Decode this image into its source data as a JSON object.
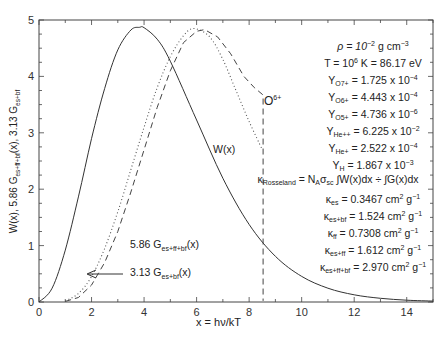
{
  "chart_data": {
    "type": "line",
    "title": "",
    "xlabel": "x = hν/kT",
    "ylabel": "W(x), 5.86 G_es+ff+bf(x), 3.13 G_es+bf",
    "xlim": [
      0,
      15
    ],
    "ylim": [
      0,
      5
    ],
    "x_ticks": [
      "0",
      "2",
      "4",
      "6",
      "8",
      "10",
      "12",
      "14"
    ],
    "y_ticks": [
      "0",
      "1",
      "2",
      "3",
      "4",
      "5"
    ],
    "grid": false,
    "series": [
      {
        "name": "W(x)",
        "style": "solid",
        "x": [
          0,
          0.5,
          1,
          1.5,
          2,
          2.5,
          3,
          3.5,
          3.83,
          4,
          4.5,
          5,
          6,
          7,
          8,
          9,
          10,
          11,
          12,
          13,
          14,
          15
        ],
        "y": [
          0,
          0.245,
          0.921,
          1.863,
          2.896,
          3.788,
          4.469,
          4.823,
          4.87,
          4.863,
          4.659,
          4.269,
          3.227,
          2.194,
          1.375,
          0.81,
          0.454,
          0.245,
          0.127,
          0.065,
          0.032,
          0.016
        ]
      },
      {
        "name": "5.86 G_es+ff+bf(x)",
        "style": "dotted",
        "x": [
          1,
          1.5,
          2,
          2.5,
          3,
          3.5,
          4,
          4.5,
          5,
          5.5,
          5.9,
          6.5,
          7,
          7.5,
          8,
          8.5
        ],
        "y": [
          0.02,
          0.15,
          0.45,
          0.95,
          1.6,
          2.35,
          3.1,
          3.8,
          4.35,
          4.72,
          4.85,
          4.7,
          4.3,
          3.75,
          3.2,
          2.7
        ]
      },
      {
        "name": "3.13 G_es+bf(x)",
        "style": "dashed",
        "x": [
          1,
          1.5,
          2,
          2.5,
          3,
          3.5,
          4,
          4.5,
          5,
          5.5,
          6,
          6.3,
          6.8,
          7.3,
          7.8,
          8.2,
          8.53,
          8.53
        ],
        "y": [
          0.01,
          0.08,
          0.3,
          0.7,
          1.25,
          1.95,
          2.7,
          3.45,
          4.1,
          4.6,
          4.8,
          4.83,
          4.7,
          4.4,
          4.0,
          3.8,
          3.67,
          0.02
        ]
      }
    ],
    "annotations": [
      "O6+",
      "W(x)",
      "5.86 G_es+ff+bf(x)",
      "3.13 G_es+bf(x)"
    ]
  },
  "labels": {
    "xlabel": "x = hν/kT",
    "o6": "O",
    "o6_sup": "6+",
    "wx": "W(x)",
    "g1_pre": "5.86 G",
    "g1_sub": "es+ff+bf",
    "g1_post": "(x)",
    "g2_pre": "3.13 G",
    "g2_sub": "es+bf",
    "g2_post": "(x)",
    "y_pre": "W(x), 5.86 G",
    "y_sub1": "es+ff+bf",
    "y_mid": "(x), 3.13 G",
    "y_sub2": "es+bf"
  },
  "params": {
    "rho": {
      "pre": "ρ = 10",
      "sup": "−2",
      "post": " g cm",
      "sup2": "−3"
    },
    "T": {
      "pre": "T = 10",
      "sup": "6",
      "post": " K = 86.17 eV"
    },
    "Y_O7": {
      "sub": "O7+",
      "val": " = 1.725 x 10",
      "sup": "−4"
    },
    "Y_O6": {
      "sub": "O6+",
      "val": " = 4.443 x 10",
      "sup": "−4"
    },
    "Y_O5": {
      "sub": "O5+",
      "val": " = 4.736 x 10",
      "sup": "−6"
    },
    "Y_Hepp": {
      "sub": "He++",
      "val": " = 6.225 x 10",
      "sup": "−2"
    },
    "Y_Hep": {
      "sub": "He+",
      "val": " = 2.522 x 10",
      "sup": "−4"
    },
    "Y_H": {
      "sub": "H",
      "val": " = 1.867 x 10",
      "sup": "−3"
    },
    "kR": {
      "sub": "Rosseland",
      "eq": " = N",
      "sub2": "A",
      "sig": "σ",
      "sub3": "sc",
      "body": " ∫W(x)dx ÷ ∫G(x)dx"
    },
    "k_es": {
      "sub": "es",
      "val": " = 0.3467 cm",
      "unit_sup": "2",
      "unit": " g",
      "unit_sup2": "−1"
    },
    "k_esbf": {
      "sub": "es+bf",
      "val": " = 1.524 cm",
      "unit_sup": "2",
      "unit": " g",
      "unit_sup2": "−1"
    },
    "k_ff": {
      "sub": "ff",
      "val": " = 0.7308 cm",
      "unit_sup": "2",
      "unit": " g",
      "unit_sup2": "−1"
    },
    "k_esff": {
      "sub": "es+ff",
      "val": " = 1.612 cm",
      "unit_sup": "2",
      "unit": " g",
      "unit_sup2": "−1"
    },
    "k_esffbf": {
      "sub": "es+ff+bf",
      "val": " = 2.970 cm",
      "unit_sup": "2",
      "unit": " g",
      "unit_sup2": "−1"
    }
  }
}
